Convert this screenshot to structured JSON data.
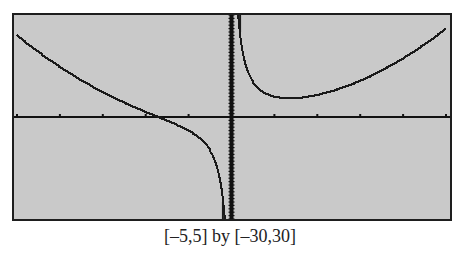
{
  "caption": "[–5,5] by [–30,30]",
  "colors": {
    "screen_bg": "#c9c9c9",
    "frame": "#1e1e1e",
    "curve": "#1a1a1a",
    "axis": "#111111"
  },
  "chart_data": {
    "type": "line",
    "title": "",
    "caption": "[–5,5] by [–30,30]",
    "xlabel": "",
    "ylabel": "",
    "xlim": [
      -5,
      5
    ],
    "ylim": [
      -30,
      30
    ],
    "xscl": 1,
    "yscl": 1,
    "grid": false,
    "legend": null,
    "function": "y = x^2 + 5/x (estimated fit)",
    "vertical_asymptote": 0,
    "series": [
      {
        "name": "f(x)",
        "branch": "left",
        "x": [
          -5,
          -4.5,
          -4,
          -3.5,
          -3,
          -2.5,
          -2,
          -1.71,
          -1.5,
          -1.25,
          -1,
          -0.8,
          -0.6,
          -0.5,
          -0.4,
          -0.3,
          -0.25,
          -0.2,
          -0.17
        ],
        "y": [
          24,
          19.1,
          14.75,
          10.82,
          7.33,
          4.25,
          1.5,
          0,
          -1.08,
          -2.44,
          -4,
          -5.61,
          -7.97,
          -9.75,
          -12.34,
          -16.58,
          -19.94,
          -24.96,
          -29.4
        ]
      },
      {
        "name": "f(x)",
        "branch": "right",
        "x": [
          0.17,
          0.2,
          0.25,
          0.3,
          0.4,
          0.5,
          0.6,
          0.8,
          1,
          1.25,
          1.36,
          1.5,
          2,
          2.5,
          3,
          3.5,
          4,
          4.5,
          5
        ],
        "y": [
          29.44,
          25.04,
          20.06,
          16.76,
          12.66,
          10.25,
          8.69,
          6.89,
          6,
          5.56,
          5.52,
          5.58,
          6.5,
          8.25,
          10.67,
          13.68,
          17.25,
          21.36,
          26
        ]
      }
    ]
  }
}
